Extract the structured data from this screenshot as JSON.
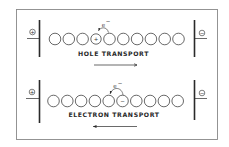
{
  "colors": {
    "ink": "#2a2a2a",
    "frame": "#888888",
    "background": "#ffffff"
  },
  "panels": [
    {
      "id": "hole",
      "label": "HOLE TRANSPORT",
      "left_electrode_symbol": "+",
      "right_electrode_symbol": "−",
      "site_count": 10,
      "charged_site_index": 3,
      "charged_site_symbol": "+",
      "hop_label": "e",
      "hop_label_sup": "−",
      "hop_direction": "from site 5 into site 4 (electron hops left)",
      "arrow_direction": "right"
    },
    {
      "id": "electron",
      "label": "ELECTRON TRANSPORT",
      "left_electrode_symbol": "+",
      "right_electrode_symbol": "−",
      "site_count": 10,
      "charged_site_index": 5,
      "charged_site_symbol": "−",
      "hop_label": "e",
      "hop_label_sup": "−",
      "hop_direction": "from site 6 into site 5 (electron hops left)",
      "arrow_direction": "left"
    }
  ]
}
